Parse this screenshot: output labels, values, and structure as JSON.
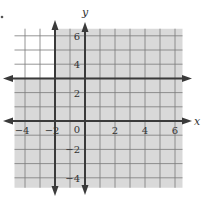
{
  "chart_data": {
    "type": "inequality-graph",
    "title": "",
    "xlabel": "x",
    "ylabel": "y",
    "xlim": [
      -4.7,
      6.5
    ],
    "ylim": [
      -4.7,
      6.5
    ],
    "grid": true,
    "grid_step": 1,
    "x_ticks": [
      {
        "value": -4,
        "label": "−4"
      },
      {
        "value": -2,
        "label": "−2"
      },
      {
        "value": 2,
        "label": "2"
      },
      {
        "value": 4,
        "label": "4"
      },
      {
        "value": 6,
        "label": "6"
      }
    ],
    "y_ticks": [
      {
        "value": 6,
        "label": "6"
      },
      {
        "value": 4,
        "label": "4"
      },
      {
        "value": 2,
        "label": "2"
      },
      {
        "value": -2,
        "label": "−2"
      },
      {
        "value": -4,
        "label": "−4"
      }
    ],
    "origin_label": "0",
    "boundary_lines": [
      {
        "equation": "x = -2",
        "style": "solid",
        "arrows": "both"
      },
      {
        "equation": "y = 3",
        "style": "solid",
        "arrows": "both"
      }
    ],
    "shaded_region": "x >= -2 or y <= 3",
    "unshaded_region": "x < -2 and y > 3",
    "colors": {
      "shade": "#d9d9d9",
      "grid": "#7a7a7a",
      "line": "#3a3a3a"
    }
  }
}
